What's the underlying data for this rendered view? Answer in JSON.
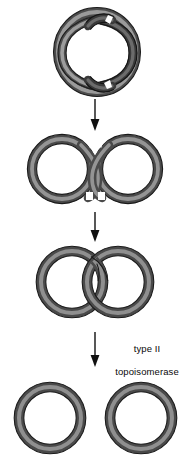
{
  "figure": {
    "background_color": "#ffffff",
    "colors": {
      "strand_dark": "#4a4a4a",
      "strand_mid": "#6e6e6e",
      "strand_light": "#949494",
      "outline": "#1c1c1c",
      "arrow": "#111111",
      "text": "#0a0a0a",
      "page": "#ffffff"
    },
    "label": {
      "line1": "type II",
      "line2": "topoisomerase"
    },
    "stages": [
      {
        "id": "stage-1",
        "name": "supercoiled-intertwined-dna",
        "caption": "",
        "center_x": 97,
        "center_y": 52
      },
      {
        "id": "stage-2",
        "name": "figure-eight-dna",
        "caption": "",
        "center_x": 95,
        "center_y": 169
      },
      {
        "id": "stage-3",
        "name": "catenated-rings-dna",
        "caption": "",
        "center_x": 95,
        "center_y": 282
      },
      {
        "id": "stage-4",
        "name": "separated-rings-dna",
        "caption": "",
        "center_x": 95,
        "center_y": 418
      }
    ],
    "arrows": [
      {
        "id": "arrow-1",
        "name": "arrow-stage1-to-stage2",
        "x": 95,
        "y_start": 99,
        "y_end": 130,
        "label": ""
      },
      {
        "id": "arrow-2",
        "name": "arrow-stage2-to-stage3",
        "x": 95,
        "y_start": 210,
        "y_end": 241,
        "label": ""
      },
      {
        "id": "arrow-3",
        "name": "arrow-stage3-to-stage4",
        "x": 95,
        "y_start": 330,
        "y_end": 366,
        "label": "type II topoisomerase"
      }
    ]
  }
}
